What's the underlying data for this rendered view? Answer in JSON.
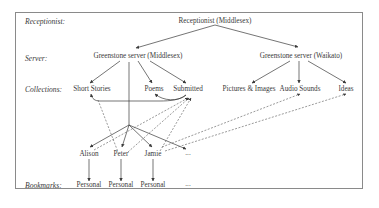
{
  "rows": {
    "receptionist": "Receptionist:",
    "server": "Server:",
    "collections": "Collections:",
    "bookmarks": "Bookmarks:"
  },
  "nodes": {
    "receptionist_middlesex": "Receptionist (Middlesex)",
    "server_middlesex": "Greenstone server (Middlesex)",
    "server_waikato": "Greenstone server (Waikato)",
    "short_stories": "Short Stories",
    "poems": "Poems",
    "submitted": "Submitted",
    "pictures_images": "Pictures & Images",
    "audio_sounds": "Audio Sounds",
    "ideas": "Ideas",
    "users": [
      "Alison",
      "Peter",
      "Jamie",
      "..."
    ],
    "bookmarks": [
      "Personal",
      "Personal",
      "Personal",
      "..."
    ]
  },
  "colors": {
    "line": "#3a3a3a",
    "frame": "#8a8a8a",
    "dashed": "#555555"
  }
}
